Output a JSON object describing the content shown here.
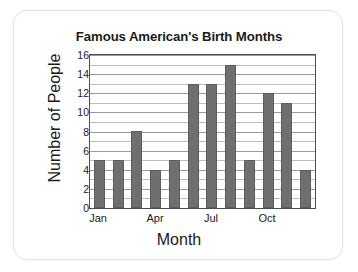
{
  "chart_data": {
    "type": "bar",
    "title": "Famous American's Birth Months",
    "xlabel": "Month",
    "ylabel": "Number of People",
    "categories": [
      "Jan",
      "Feb",
      "Mar",
      "Apr",
      "May",
      "Jun",
      "Jul",
      "Aug",
      "Sep",
      "Oct",
      "Nov",
      "Dec"
    ],
    "values": [
      5,
      5,
      8,
      4,
      5,
      13,
      13,
      15,
      5,
      12,
      11,
      4
    ],
    "visible_x_tick_labels": [
      "Jan",
      "Apr",
      "Jul",
      "Oct"
    ],
    "visible_x_tick_indices": [
      0,
      3,
      6,
      9
    ],
    "ylim": [
      0,
      16
    ],
    "y_major_ticks": [
      0,
      2,
      4,
      6,
      8,
      10,
      12,
      14,
      16
    ],
    "y_minor_step": 1,
    "grid": true,
    "grid_axis": "y",
    "legend": false,
    "bar_color": "#6f6f6f",
    "axis_color": "#4d4d4d",
    "gridline_color": "#9a9a9a",
    "background_color": "#ffffff"
  },
  "card": {
    "border_color": "#e3e3e3"
  }
}
